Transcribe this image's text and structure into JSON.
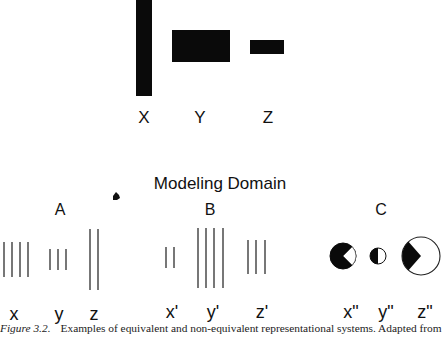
{
  "world": {
    "labels": [
      "X",
      "Y",
      "Z"
    ],
    "bars": [
      {
        "name": "X",
        "shape": "tall-narrow-bar"
      },
      {
        "name": "Y",
        "shape": "wide-rectangle"
      },
      {
        "name": "Z",
        "shape": "small-rectangle"
      }
    ]
  },
  "modeling_domain": {
    "title": "Modeling Domain",
    "systems": [
      {
        "label": "A",
        "items": [
          {
            "label": "x",
            "line_count": 4
          },
          {
            "label": "y",
            "line_count": 3
          },
          {
            "label": "z",
            "line_count": 2
          }
        ]
      },
      {
        "label": "B",
        "items": [
          {
            "label": "x'",
            "line_count": 2
          },
          {
            "label": "y'",
            "line_count": 4
          },
          {
            "label": "z'",
            "line_count": 3
          }
        ]
      },
      {
        "label": "C",
        "items": [
          {
            "label": "x\"",
            "glyph": "black-circle-with-white-wedge"
          },
          {
            "label": "y\"",
            "glyph": "half-black-circle"
          },
          {
            "label": "z\"",
            "glyph": "white-circle-with-black-wedge"
          }
        ]
      }
    ]
  },
  "caption": {
    "figure_label": "Figure 3.2.",
    "text": "Examples of equivalent and non-equivalent representational systems. Adapted from"
  }
}
